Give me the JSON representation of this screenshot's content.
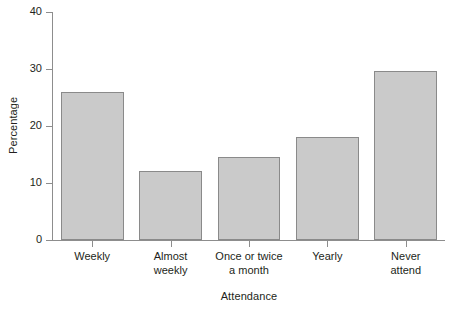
{
  "chart_data": {
    "type": "bar",
    "title": "",
    "xlabel": "Attendance",
    "ylabel": "Percentage",
    "categories": [
      "Weekly",
      "Almost weekly",
      "Once or twice a month",
      "Yearly",
      "Never attend"
    ],
    "category_lines": [
      [
        "Weekly"
      ],
      [
        "Almost",
        "weekly"
      ],
      [
        "Once or twice",
        "a month"
      ],
      [
        "Yearly"
      ],
      [
        "Never",
        "attend"
      ]
    ],
    "values": [
      25.9,
      12.1,
      14.5,
      18.0,
      29.6
    ],
    "ylim": [
      0,
      40
    ],
    "yticks": [
      0,
      10,
      20,
      30,
      40
    ],
    "ytick_labels": [
      "0",
      "10",
      "20",
      "30",
      "40"
    ],
    "grid": false,
    "legend": false,
    "bar_fill_color": "#cacaca",
    "bar_edge_color": "#8a8a8a",
    "axis_color": "#8d8d8d",
    "text_color": "#231f20",
    "background_color": "#ffffff"
  }
}
